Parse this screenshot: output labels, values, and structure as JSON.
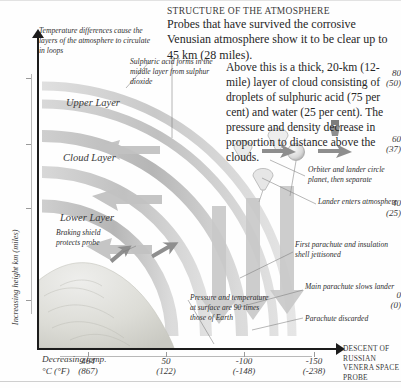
{
  "title": "STRUCTURE OF THE ATMOSPHERE",
  "intro": "Probes that have survived the corrosive Venusian atmosphere show it to be clear up to 45 km (28 miles).",
  "body2": "Above this is a thick, 20-km (12-mile) layer of cloud consisting of droplets of sulphuric acid (75 per cent) and water (25 per cent). The pressure and density decrease in proportion to distance above the clouds.",
  "layers": [
    {
      "label": "Upper Layer"
    },
    {
      "label": "Cloud Layer"
    },
    {
      "label": "Lower Layer"
    }
  ],
  "notes": {
    "temp_diff": "Temperature differences cause the layers of the atmosphere to circulate in loops",
    "sulphuric": "Sulphuric acid forms in the middle layer from sulphur dioxide",
    "braking": "Braking shield protects probe",
    "pressure": "Pressure and temperature at surface are 90 times those of Earth",
    "orbiter": "Orbiter and lander circle planet, then separate",
    "lander": "Lander enters atmosphere",
    "first_parachute": "First parachute and insulation shell jettisoned",
    "main_parachute": "Main parachute slows lander",
    "parachute_discarded": "Parachute discarded"
  },
  "axes": {
    "y_title": "Increasing height km (miles)",
    "y_ticks": [
      {
        "value": "80",
        "alt": "(50)",
        "pos": 78
      },
      {
        "value": "60",
        "alt": "(37)",
        "pos": 144
      },
      {
        "value": "40",
        "alt": "(25)",
        "pos": 208
      },
      {
        "value": "0",
        "alt": "(0)",
        "pos": 300
      }
    ],
    "x_title": "Decreasing temp. °C (°F)",
    "x_ticks": [
      {
        "value": "464",
        "alt": "(867)",
        "pos": 88
      },
      {
        "value": "50",
        "alt": "(122)",
        "pos": 166
      },
      {
        "value": "-100",
        "alt": "(-148)",
        "pos": 244
      },
      {
        "value": "-150",
        "alt": "(-238)",
        "pos": 314
      }
    ],
    "descent_caption": "DESCENT OF RUSSIAN VENERA SPACE PROBE"
  },
  "colors": {
    "arc_light": "#e9e9e9",
    "arc_mid": "#cfcfcf",
    "arc_dark": "#b5b5b5",
    "ink": "#1c1c1c",
    "surface": "#dcdcd8"
  }
}
